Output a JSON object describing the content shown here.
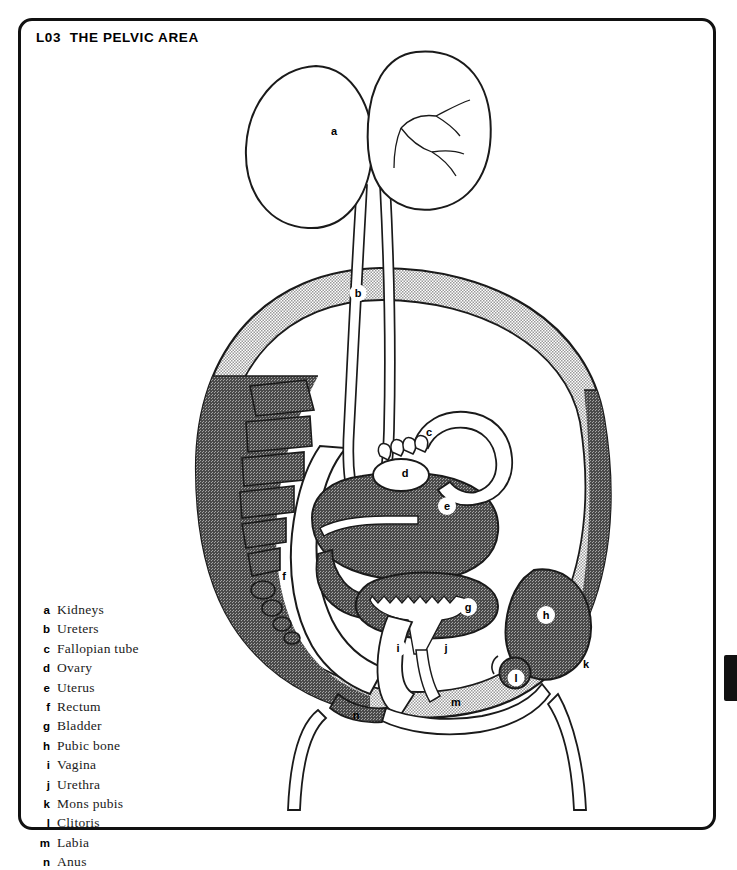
{
  "plate": {
    "code": "L03",
    "title": "THE PELVIC AREA",
    "title_full": "L03  THE PELVIC AREA"
  },
  "colors": {
    "ink": "#111111",
    "outline": "#1a1a1a",
    "paper": "#ffffff",
    "tissue_light": "#d2d2d2",
    "tissue_dark": "#8f8f8f",
    "organ_fill": "#8f8f8f",
    "lumen": "#ffffff",
    "tab": "#111111"
  },
  "legend": {
    "items": [
      {
        "key": "a",
        "label": "Kidneys"
      },
      {
        "key": "b",
        "label": "Ureters"
      },
      {
        "key": "c",
        "label": "Fallopian tube"
      },
      {
        "key": "d",
        "label": "Ovary"
      },
      {
        "key": "e",
        "label": "Uterus"
      },
      {
        "key": "f",
        "label": "Rectum"
      },
      {
        "key": "g",
        "label": "Bladder"
      },
      {
        "key": "h",
        "label": "Pubic bone"
      },
      {
        "key": "i",
        "label": "Vagina"
      },
      {
        "key": "j",
        "label": "Urethra"
      },
      {
        "key": "k",
        "label": "Mons pubis"
      },
      {
        "key": "l",
        "label": "Clitoris"
      },
      {
        "key": "m",
        "label": "Labia"
      },
      {
        "key": "n",
        "label": "Anus"
      }
    ]
  },
  "figure": {
    "callouts": [
      {
        "key": "a",
        "style": "plain",
        "x": 316,
        "y": 113,
        "organ": "Kidneys"
      },
      {
        "key": "b",
        "style": "badge",
        "x": 340,
        "y": 275,
        "organ": "Ureters"
      },
      {
        "key": "c",
        "style": "plain",
        "x": 411,
        "y": 414,
        "organ": "Fallopian tube"
      },
      {
        "key": "d",
        "style": "plain",
        "x": 387,
        "y": 455,
        "organ": "Ovary"
      },
      {
        "key": "e",
        "style": "badge",
        "x": 429,
        "y": 488,
        "organ": "Uterus"
      },
      {
        "key": "f",
        "style": "plain",
        "x": 266,
        "y": 558,
        "organ": "Rectum"
      },
      {
        "key": "g",
        "style": "badge",
        "x": 450,
        "y": 589,
        "organ": "Bladder"
      },
      {
        "key": "h",
        "style": "badge",
        "x": 528,
        "y": 597,
        "organ": "Pubic bone"
      },
      {
        "key": "i",
        "style": "badge",
        "x": 380,
        "y": 630,
        "organ": "Vagina"
      },
      {
        "key": "j",
        "style": "badge",
        "x": 428,
        "y": 630,
        "organ": "Urethra"
      },
      {
        "key": "k",
        "style": "plain",
        "x": 568,
        "y": 646,
        "organ": "Mons pubis"
      },
      {
        "key": "l",
        "style": "badge",
        "x": 498,
        "y": 660,
        "organ": "Clitoris"
      },
      {
        "key": "m",
        "style": "plain",
        "x": 438,
        "y": 684,
        "organ": "Labia"
      },
      {
        "key": "n",
        "style": "plain",
        "x": 338,
        "y": 697,
        "organ": "Anus"
      }
    ]
  }
}
